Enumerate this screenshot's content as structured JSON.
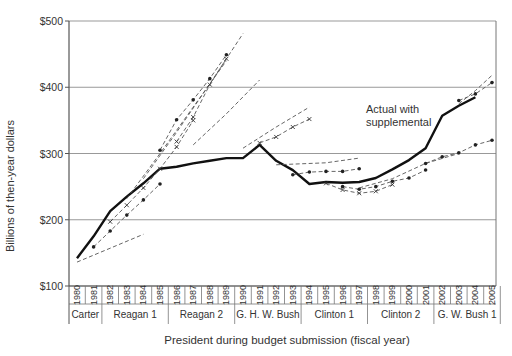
{
  "chart_data": {
    "type": "line",
    "title": "",
    "xlabel": "President during budget submission (fiscal year)",
    "ylabel": "Billions of then-year dollars",
    "ylim": [
      100,
      500
    ],
    "y_ticks": [
      "$100",
      "$200",
      "$300",
      "$400",
      "$500"
    ],
    "y_tick_values": [
      100,
      200,
      300,
      400,
      500
    ],
    "grid": true,
    "x": [
      1980,
      1981,
      1982,
      1983,
      1984,
      1985,
      1986,
      1987,
      1988,
      1989,
      1990,
      1991,
      1992,
      1993,
      1994,
      1995,
      1996,
      1997,
      1998,
      1999,
      2000,
      2001,
      2002,
      2003,
      2004,
      2005
    ],
    "x_tick_labels": [
      "1980",
      "1981",
      "1982",
      "1983",
      "1984",
      "1985",
      "1986",
      "1987",
      "1988",
      "1989",
      "1990",
      "1991",
      "1992",
      "1993",
      "1994",
      "1995",
      "1996",
      "1997",
      "1998",
      "1999",
      "2000",
      "2001",
      "2002",
      "2003",
      "2004",
      "2005"
    ],
    "president_groups": [
      {
        "label": "Carter",
        "start": 1980,
        "end": 1981
      },
      {
        "label": "Reagan 1",
        "start": 1982,
        "end": 1985
      },
      {
        "label": "Reagan 2",
        "start": 1986,
        "end": 1989
      },
      {
        "label": "G. H. W. Bush",
        "start": 1990,
        "end": 1993
      },
      {
        "label": "Clinton 1",
        "start": 1994,
        "end": 1997
      },
      {
        "label": "Clinton 2",
        "start": 1998,
        "end": 2001
      },
      {
        "label": "G. W. Bush 1",
        "start": 2002,
        "end": 2005
      }
    ],
    "annotations": [
      {
        "text": "Actual with",
        "x": 1998,
        "y": 345
      },
      {
        "text": "supplemental",
        "x": 1998,
        "y": 332
      }
    ],
    "series": [
      {
        "name": "Actual with supplemental",
        "style": "solid-bold",
        "x": [
          1980,
          1981,
          1982,
          1983,
          1984,
          1985,
          1986,
          1987,
          1988,
          1989,
          1990,
          1991,
          1992,
          1993,
          1994,
          1995,
          1996,
          1997,
          1998,
          1999,
          2000,
          2001,
          2002,
          2003,
          2004
        ],
        "values": [
          142,
          175,
          213,
          235,
          255,
          277,
          280,
          285,
          289,
          293,
          293,
          313,
          289,
          275,
          254,
          257,
          256,
          257,
          263,
          276,
          290,
          308,
          357,
          372,
          385
        ]
      },
      {
        "name": "Carter FY1980 projection",
        "style": "dashed",
        "x": [
          1980,
          1984
        ],
        "values": [
          136,
          178
        ]
      },
      {
        "name": "Carter FY1981 projection",
        "style": "dashed-dot",
        "x": [
          1981,
          1982,
          1983,
          1984,
          1985
        ],
        "values": [
          159,
          183,
          207,
          230,
          254
        ]
      },
      {
        "name": "Reagan FY1982 projection",
        "style": "dashed-x",
        "x": [
          1982,
          1983,
          1984,
          1985,
          1986,
          1987
        ],
        "values": [
          197,
          222,
          248,
          277,
          310,
          350
        ]
      },
      {
        "name": "Reagan FY1983 projection",
        "style": "dashed",
        "x": [
          1983,
          1985,
          1987,
          1989
        ],
        "values": [
          232,
          300,
          370,
          440
        ]
      },
      {
        "name": "Reagan FY1984 projection",
        "style": "dashed",
        "x": [
          1984,
          1986,
          1988,
          1990
        ],
        "values": [
          262,
          332,
          405,
          481
        ]
      },
      {
        "name": "Reagan FY1985 projection",
        "style": "dashed-dot",
        "x": [
          1985,
          1986,
          1987,
          1988,
          1989
        ],
        "values": [
          305,
          351,
          381,
          413,
          449
        ]
      },
      {
        "name": "Reagan FY1986 projection",
        "style": "dashed-x",
        "x": [
          1986,
          1987,
          1988,
          1989
        ],
        "values": [
          318,
          355,
          404,
          443
        ]
      },
      {
        "name": "Reagan FY1987 projection",
        "style": "dashed",
        "x": [
          1987,
          1989,
          1991
        ],
        "values": [
          313,
          360,
          411
        ]
      },
      {
        "name": "Bush FY1990 projection",
        "style": "dashed",
        "x": [
          1990,
          1992,
          1994
        ],
        "values": [
          308,
          340,
          370
        ]
      },
      {
        "name": "Bush FY1991 projection",
        "style": "dashed-x",
        "x": [
          1991,
          1992,
          1993,
          1994
        ],
        "values": [
          316,
          325,
          340,
          352
        ]
      },
      {
        "name": "Bush FY1992 projection",
        "style": "dashed",
        "x": [
          1992,
          1995,
          1997
        ],
        "values": [
          283,
          286,
          293
        ]
      },
      {
        "name": "Clinton FY1994 projection",
        "style": "dashed-dot",
        "x": [
          1993,
          1994,
          1995,
          1996,
          1997
        ],
        "values": [
          268,
          272,
          273,
          273,
          277
        ]
      },
      {
        "name": "Clinton FY1995 projection",
        "style": "dashed-x",
        "x": [
          1995,
          1996,
          1997,
          1998,
          1999
        ],
        "values": [
          255,
          245,
          240,
          243,
          253
        ]
      },
      {
        "name": "Clinton FY1996 projection",
        "style": "dashed-dot",
        "x": [
          1996,
          1997,
          1998,
          1999,
          2000,
          2001
        ],
        "values": [
          250,
          246,
          250,
          258,
          263,
          275
        ]
      },
      {
        "name": "Clinton FY1998 projection",
        "style": "dashed",
        "x": [
          1997,
          1999,
          2001,
          2003
        ],
        "values": [
          248,
          262,
          285,
          300
        ]
      },
      {
        "name": "G. W. Bush FY2002 projection",
        "style": "dashed-dot",
        "x": [
          2001,
          2002,
          2003,
          2004,
          2005
        ],
        "values": [
          285,
          295,
          301,
          313,
          320
        ]
      },
      {
        "name": "G. W. Bush FY2004 projection",
        "style": "dashed-dot",
        "x": [
          2003,
          2004,
          2005
        ],
        "values": [
          380,
          390,
          407
        ]
      },
      {
        "name": "G. W. Bush FY2005 projection",
        "style": "dashed",
        "x": [
          2003,
          2004,
          2005
        ],
        "values": [
          375,
          395,
          418
        ]
      }
    ]
  }
}
